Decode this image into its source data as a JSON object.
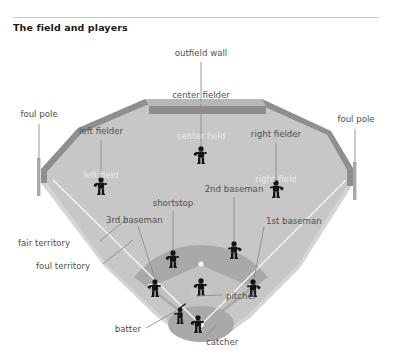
{
  "header": {
    "title": "The field and players"
  },
  "figure": {
    "name": "baseball-field-diagram",
    "colors": {
      "outfield_grass": "#c7c7c7",
      "foul_territory": "#d5d5d5",
      "infield_dirt": "#a9a9a9",
      "infield_grass": "#c2c2c2",
      "wall_top": "#b4b4b4",
      "wall_front": "#8f8f8f",
      "wall_rim": "#9a9a9a",
      "player": "#141414",
      "line_white": "#f4f4f4",
      "label_text": "#50504e",
      "field_label_text": "#e9e9e9",
      "leader_line": "#8d8d8d",
      "foul_pole": "#a3a3a3"
    },
    "labels": {
      "outfield_wall": "outfield wall",
      "foul_pole_left": "foul pole",
      "foul_pole_right": "foul pole",
      "center_fielder": "center fielder",
      "left_fielder": "left fielder",
      "right_fielder": "right fielder",
      "center_field": "center field",
      "left_field": "left field",
      "right_field": "right field",
      "shortstop": "shortstop",
      "second_baseman": "2nd baseman",
      "third_baseman": "3rd baseman",
      "first_baseman": "1st baseman",
      "fair_territory": "fair territory",
      "foul_territory": "foul territory",
      "pitcher": "pitcher",
      "batter": "batter",
      "catcher": "catcher"
    }
  }
}
